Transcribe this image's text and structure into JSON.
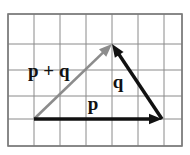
{
  "figure": {
    "background_color": "#ffffff",
    "canvas": {
      "width": 190,
      "height": 155
    }
  },
  "grid": {
    "name": "graph-paper-grid",
    "line_color": "#8a8a8a",
    "border_color": "#7a7a7a",
    "fill_color": "#ffffff",
    "cell_size": 26,
    "columns": 7,
    "rows": 5,
    "left": 8,
    "top": 14,
    "right": 182,
    "bottom": 146,
    "x_lines": [
      8,
      34,
      60,
      86,
      112,
      138,
      164,
      182
    ],
    "y_lines": [
      14,
      44,
      70,
      96,
      119,
      146
    ]
  },
  "vectors": [
    {
      "id": "p",
      "label": "p",
      "color": "#111111",
      "stroke_width": 3.4,
      "start": {
        "x": 34,
        "y": 119
      },
      "end": {
        "x": 162,
        "y": 119
      },
      "arrowhead": "filled-triangle",
      "label_position": {
        "x": 93,
        "y": 110
      },
      "label_font_size": 19
    },
    {
      "id": "q",
      "label": "q",
      "color": "#111111",
      "stroke_width": 3.4,
      "start": {
        "x": 162,
        "y": 119
      },
      "end": {
        "x": 112,
        "y": 44
      },
      "arrowhead": "filled-triangle",
      "label_position": {
        "x": 118,
        "y": 88
      },
      "label_font_size": 19
    },
    {
      "id": "p_plus_q",
      "label": "p + q",
      "color": "#8c8c8c",
      "stroke_width": 2.6,
      "start": {
        "x": 34,
        "y": 119
      },
      "end": {
        "x": 112,
        "y": 44
      },
      "arrowhead": "filled-triangle",
      "label_position": {
        "x": 28,
        "y": 77
      },
      "label_font_size": 19
    }
  ],
  "labels": {
    "p": "p",
    "q": "q",
    "p_plus_q": "p + q"
  }
}
